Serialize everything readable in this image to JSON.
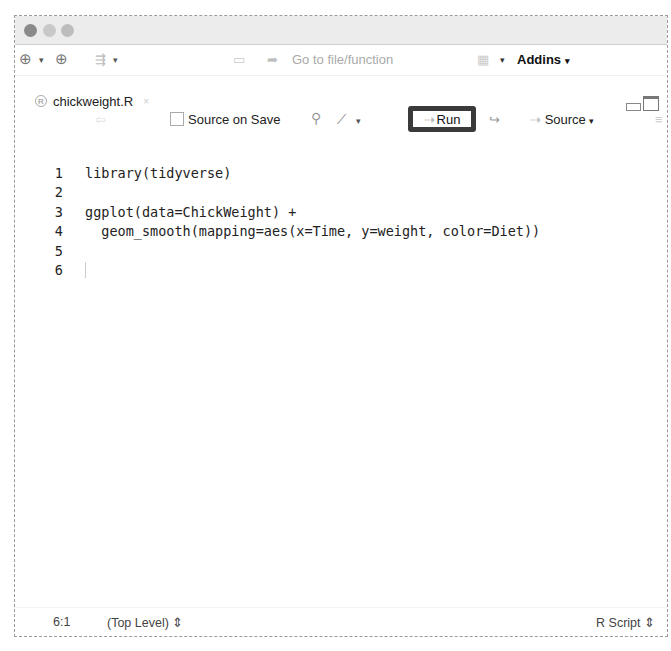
{
  "main_toolbar": {
    "new_file_icon": "⊕",
    "open_icon": "⊕",
    "goto_placeholder": "Go to file/function",
    "addins_label": "Addins"
  },
  "editor_tab": {
    "filename": "chickweight.R"
  },
  "editor_toolbar": {
    "source_on_save_label": "Source on Save",
    "run_label": "Run",
    "source_label": "Source"
  },
  "code_lines": [
    {
      "n": "1",
      "text": "library(tidyverse)"
    },
    {
      "n": "2",
      "text": ""
    },
    {
      "n": "3",
      "text": "ggplot(data=ChickWeight) +"
    },
    {
      "n": "4",
      "text": "  geom_smooth(mapping=aes(x=Time, y=weight, color=Diet))"
    },
    {
      "n": "5",
      "text": ""
    },
    {
      "n": "6",
      "text": ""
    }
  ],
  "status_bar": {
    "position": "6:1",
    "scope": "(Top Level) ⇕",
    "file_type": "R Script ⇕"
  }
}
